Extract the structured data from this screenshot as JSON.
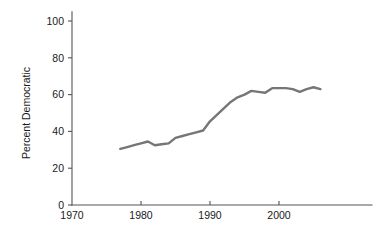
{
  "chart_data": {
    "type": "line",
    "title": "",
    "subtitle": "",
    "xlabel": "",
    "ylabel": "Percent Democratic",
    "xlim": [
      1970,
      2008
    ],
    "ylim": [
      0,
      105
    ],
    "grid": false,
    "legend": false,
    "legend_position": "none",
    "line_color": "#767676",
    "axis_color": "#555555",
    "background_color": "#ffffff",
    "xticks": [
      1970,
      1980,
      1990,
      2000
    ],
    "xtick_labels": [
      "1970",
      "1980",
      "1990",
      "2000"
    ],
    "yticks": [
      0,
      20,
      40,
      60,
      80,
      100
    ],
    "ytick_labels": [
      "0",
      "20",
      "40",
      "60",
      "80",
      "100"
    ],
    "series": [
      {
        "name": "Percent Democratic",
        "color": "#767676",
        "x": [
          1977,
          1978,
          1979,
          1980,
          1981,
          1982,
          1983,
          1984,
          1985,
          1986,
          1987,
          1988,
          1989,
          1990,
          1991,
          1992,
          1993,
          1994,
          1995,
          1996,
          1997,
          1998,
          1999,
          2000,
          2001,
          2002,
          2003,
          2004,
          2005,
          2006
        ],
        "values": [
          30.5,
          31.5,
          32.5,
          33.5,
          34.5,
          32.5,
          33.0,
          33.5,
          36.5,
          37.5,
          38.5,
          39.5,
          40.5,
          45.5,
          49.0,
          52.5,
          56.0,
          58.5,
          60.0,
          62.0,
          61.5,
          61.0,
          63.5,
          63.5,
          63.5,
          63.0,
          61.5,
          63.0,
          64.0,
          63.0
        ]
      }
    ]
  },
  "axes": {
    "ylabel_text": "Percent Democratic"
  }
}
